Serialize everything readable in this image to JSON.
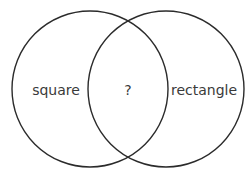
{
  "venn": {
    "left_set": {
      "label": "square",
      "cx": 90,
      "cy": 89,
      "r": 78
    },
    "right_set": {
      "label": "rectangle",
      "cx": 166,
      "cy": 89,
      "r": 78
    },
    "intersection": {
      "label": "?"
    },
    "stroke_color": "#2b2b2b",
    "text_color": "#3a3a3a"
  }
}
